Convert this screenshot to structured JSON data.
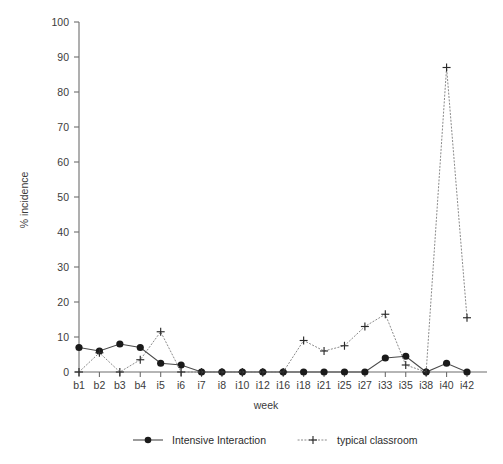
{
  "chart_data": {
    "type": "line",
    "title": "",
    "xlabel": "week",
    "ylabel": "% incidence",
    "ylim": [
      0,
      100
    ],
    "ytick_labels": [
      "0",
      "10",
      "20",
      "30",
      "40",
      "50",
      "60",
      "70",
      "80",
      "90",
      "100"
    ],
    "ytick_values": [
      0,
      10,
      20,
      30,
      40,
      50,
      60,
      70,
      80,
      90,
      100
    ],
    "grid": false,
    "legend_position": "bottom",
    "categories": [
      "b1",
      "b2",
      "b3",
      "b4",
      "i5",
      "i6",
      "i7",
      "i8",
      "i10",
      "i12",
      "i16",
      "i18",
      "i21",
      "i25",
      "i27",
      "i33",
      "i35",
      "i38",
      "i40",
      "i42"
    ],
    "series": [
      {
        "name": "Intensive Interaction",
        "marker": "filled-circle",
        "linestyle": "solid",
        "color": "#1a1a1a",
        "values": [
          7,
          6,
          8,
          7,
          2.5,
          2,
          0,
          0,
          0,
          0,
          0,
          0,
          0,
          0,
          0,
          4,
          4.5,
          0,
          2.5,
          0
        ]
      },
      {
        "name": "typical classroom",
        "marker": "plus",
        "linestyle": "dotted",
        "color": "#2b2b2b",
        "values": [
          0,
          5.5,
          0,
          3.5,
          11.5,
          0,
          0,
          0,
          0,
          0,
          0,
          9,
          6,
          7.5,
          13,
          16.5,
          2,
          0,
          87,
          15.5
        ]
      }
    ]
  },
  "legend": {
    "items": [
      {
        "label": "Intensive Interaction",
        "marker": "filled-circle",
        "linestyle": "solid"
      },
      {
        "label": "typical classroom",
        "marker": "plus",
        "linestyle": "dotted"
      }
    ]
  },
  "axes": {
    "y_title": "% incidence",
    "x_title": "week"
  }
}
